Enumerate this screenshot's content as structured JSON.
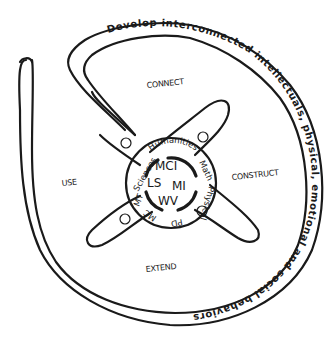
{
  "diagram": {
    "band_text": "Develop interconnected intellectuals, physical, emotional and social behaviors",
    "regions": {
      "top": "CONNECT",
      "right": "CONSTRUCT",
      "bottom": "EXTEND",
      "left": "USE"
    },
    "ring_labels": {
      "top": "Humanities",
      "right": "Math",
      "bottom_right": "Physical",
      "bottom": "PD",
      "bottom_left": "MC",
      "left_bottom": "MT",
      "left": "Sciences"
    },
    "core_labels": {
      "top": "MCI",
      "left": "LS",
      "right": "MI",
      "bottom": "WV"
    },
    "colors": {
      "ink": "#1a1a1a",
      "background": "#ffffff"
    }
  }
}
